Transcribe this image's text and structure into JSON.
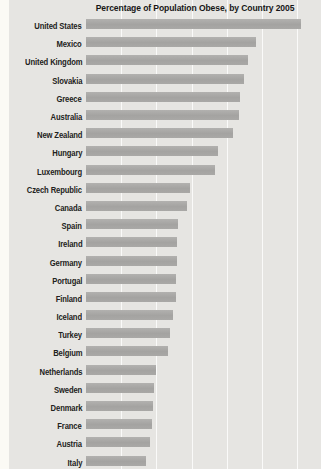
{
  "chart": {
    "title": "Percentage of Population Obese, by Country 2005",
    "panel_background": "#e6e5e2",
    "page_background": "#fbfaf5",
    "bar_color": "#a6a5a3",
    "gridline_color": "#f4f3f0",
    "text_color": "#222220"
  },
  "chart_data": {
    "type": "bar",
    "orientation": "horizontal",
    "title": "Percentage of Population Obese, by Country 2005",
    "categories": [
      "United States",
      "Mexico",
      "United Kingdom",
      "Slovakia",
      "Greece",
      "Australia",
      "New Zealand",
      "Hungary",
      "Luxembourg",
      "Czech Republic",
      "Canada",
      "Spain",
      "Ireland",
      "Germany",
      "Portugal",
      "Finland",
      "Iceland",
      "Turkey",
      "Belgium",
      "Netherlands",
      "Sweden",
      "Denmark",
      "France",
      "Austria",
      "Italy"
    ],
    "values": [
      30.6,
      24.2,
      23.0,
      22.4,
      21.9,
      21.7,
      20.9,
      18.8,
      18.4,
      14.8,
      14.3,
      13.1,
      13.0,
      12.9,
      12.8,
      12.8,
      12.4,
      12.0,
      11.7,
      10.0,
      9.7,
      9.5,
      9.4,
      9.1,
      8.5
    ],
    "xlabel": "",
    "ylabel": "",
    "xlim": [
      0,
      33.4
    ],
    "gridline_interval": 5,
    "gridline_values": [
      5,
      10,
      15,
      20,
      25,
      30
    ],
    "grid": true,
    "legend": false,
    "value_unit": "percent"
  }
}
